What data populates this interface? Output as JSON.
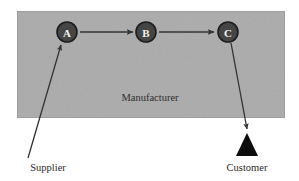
{
  "diagram": {
    "canvas": {
      "width": 299,
      "height": 181,
      "background": "#ffffff"
    },
    "zone": {
      "name": "manufacturer-zone",
      "label": "Manufacturer",
      "label_x": 150,
      "label_y": 97,
      "x": 17,
      "y": 11,
      "width": 268,
      "height": 107,
      "fill": "#ababab",
      "stroke": "#8d8d8d"
    },
    "nodes": [
      {
        "id": "node-a",
        "label": "A",
        "cx": 67,
        "cy": 32,
        "r": 10,
        "fill": "#454545",
        "stroke": "#1d1d1d",
        "text_color": "#f2f2f2"
      },
      {
        "id": "node-b",
        "label": "B",
        "cx": 146,
        "cy": 32,
        "r": 10,
        "fill": "#454545",
        "stroke": "#1d1d1d",
        "text_color": "#f2f2f2"
      },
      {
        "id": "node-c",
        "label": "C",
        "cx": 228,
        "cy": 32,
        "r": 10,
        "fill": "#454545",
        "stroke": "#1d1d1d",
        "text_color": "#f2f2f2"
      }
    ],
    "flow_arrows": [
      {
        "name": "arrow-a-to-b",
        "from": "A",
        "to": "B",
        "x1": 80,
        "y1": 32,
        "x2": 133,
        "y2": 32,
        "color": "#333333"
      },
      {
        "name": "arrow-b-to-c",
        "from": "B",
        "to": "C",
        "x1": 159,
        "y1": 32,
        "x2": 214,
        "y2": 32,
        "color": "#333333"
      }
    ],
    "connector_arrows": [
      {
        "name": "arrow-supplier-to-a",
        "from": "Supplier",
        "to": "A",
        "x1": 28,
        "y1": 158,
        "x2": 61,
        "y2": 45,
        "color": "#333333"
      },
      {
        "name": "arrow-c-to-customer",
        "from": "C",
        "to": "Customer",
        "x1": 231,
        "y1": 43,
        "x2": 247,
        "y2": 129,
        "color": "#333333"
      }
    ],
    "markers": [
      {
        "name": "customer-triangle",
        "shape": "triangle",
        "apex_x": 247,
        "apex_y": 133,
        "left_x": 236,
        "right_x": 258,
        "base_y": 156,
        "fill": "#0d0d0d"
      }
    ],
    "external_labels": [
      {
        "name": "supplier-label",
        "text": "Supplier",
        "x": 48,
        "y": 167
      },
      {
        "name": "customer-label",
        "text": "Customer",
        "x": 247,
        "y": 167
      }
    ]
  }
}
